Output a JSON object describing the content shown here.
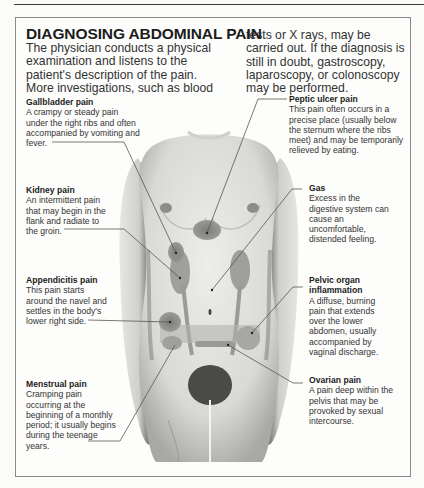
{
  "title": "DIAGNOSING ABDOMINAL PAIN",
  "intro": {
    "left": "The physician conducts a physical examination and listens to the patient's description of the pain. More investigations, such as blood",
    "right": "tests or X rays, may be carried out. If the diagnosis is still in doubt, gastroscopy, laparoscopy, or colonoscopy may be performed."
  },
  "labels": {
    "gallbladder": {
      "heading": "Gallbladder pain",
      "text": "A crampy or steady pain under the right ribs and often accompanied by vomiting and fever."
    },
    "kidney": {
      "heading": "Kidney pain",
      "text": "An intermittent pain that may begin in the flank and radiate to the groin."
    },
    "appendicitis": {
      "heading": "Appendicitis pain",
      "text": "This pain starts around the navel and settles in the body's lower right side."
    },
    "menstrual": {
      "heading": "Menstrual pain",
      "text": "Cramping pain occurring at the beginning of a monthly period; it usually begins during the teenage years."
    },
    "peptic": {
      "heading": "Peptic ulcer pain",
      "text": "This pain often occurs in a precise place (usually below the sternum where the ribs meet) and may be temporarily relieved by eating."
    },
    "gas": {
      "heading": "Gas",
      "text": "Excess in the digestive system can cause an uncomfortable, distended feeling."
    },
    "pelvic": {
      "heading": "Pelvic organ inflammation",
      "text": "A diffuse, burning pain that extends over the lower abdomen, usually accompanied by vaginal discharge."
    },
    "ovarian": {
      "heading": "Ovarian pain",
      "text": "A pain deep within the pelvis that may be provoked by sexual intercourse."
    }
  },
  "colors": {
    "ink": "#2a2a2a",
    "pain_zone": "#7a7a7a",
    "skin": "#e2e2e0",
    "frame": "#8a8a8a"
  }
}
